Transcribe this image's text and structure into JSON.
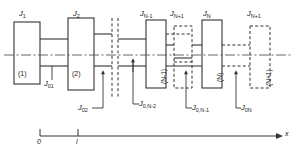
{
  "figure": {
    "type": "rotor-shaft-torsional-system-diagram"
  },
  "inertia_labels": [
    {
      "id": "J1",
      "text": "J₁",
      "base": "J",
      "sub": "1",
      "x": 22,
      "y": 11
    },
    {
      "id": "J2",
      "text": "J₂",
      "base": "J",
      "sub": "2",
      "x": 76,
      "y": 11
    },
    {
      "id": "JNm1",
      "text": "J_N-1",
      "base": "J",
      "sub": "N-1",
      "x": 141,
      "y": 11
    },
    {
      "id": "JNp1a",
      "text": "J_N+1",
      "base": "J",
      "sub": "N+1",
      "x": 171,
      "y": 11
    },
    {
      "id": "JN",
      "text": "J_N",
      "base": "J",
      "sub": "N",
      "x": 203,
      "y": 11
    },
    {
      "id": "JNp1b",
      "text": "J_N+1",
      "base": "J",
      "sub": "N+1",
      "x": 248,
      "y": 11
    }
  ],
  "station_labels": [
    {
      "id": "s1",
      "text": "(1)",
      "x": 18,
      "y": 72
    },
    {
      "id": "s2",
      "text": "(2)",
      "x": 72,
      "y": 72
    },
    {
      "id": "sNm1",
      "text": "(N-1)",
      "x": 152,
      "y": 78
    },
    {
      "id": "sN",
      "text": "(N)",
      "x": 208,
      "y": 75
    },
    {
      "id": "sNp1",
      "text": "(N+1)",
      "x": 257,
      "y": 78
    }
  ],
  "stiffness_labels": [
    {
      "id": "J01",
      "base": "J",
      "sub": "01",
      "x": 45,
      "y": 82
    },
    {
      "id": "J02",
      "base": "J",
      "sub": "02",
      "x": 81,
      "y": 112
    },
    {
      "id": "J0Nm2",
      "base": "J",
      "sub": "0,N-2",
      "x": 136,
      "y": 112
    },
    {
      "id": "J0Nm1",
      "base": "J",
      "sub": "0,N-1",
      "x": 193,
      "y": 112
    },
    {
      "id": "J0N",
      "base": "J",
      "sub": "0N",
      "x": 238,
      "y": 112
    }
  ],
  "axis": {
    "name": "x-axis",
    "arrow_label": "x",
    "ticks": [
      {
        "label": "0",
        "x": 40
      },
      {
        "label": "l",
        "x": 78
      }
    ],
    "line_y": 136,
    "x_start": 40,
    "x_end": 278,
    "label_x": 283,
    "label_y": 130
  },
  "colors": {
    "stroke": "#333333",
    "centreline": "#555555",
    "background": "#ffffff"
  }
}
